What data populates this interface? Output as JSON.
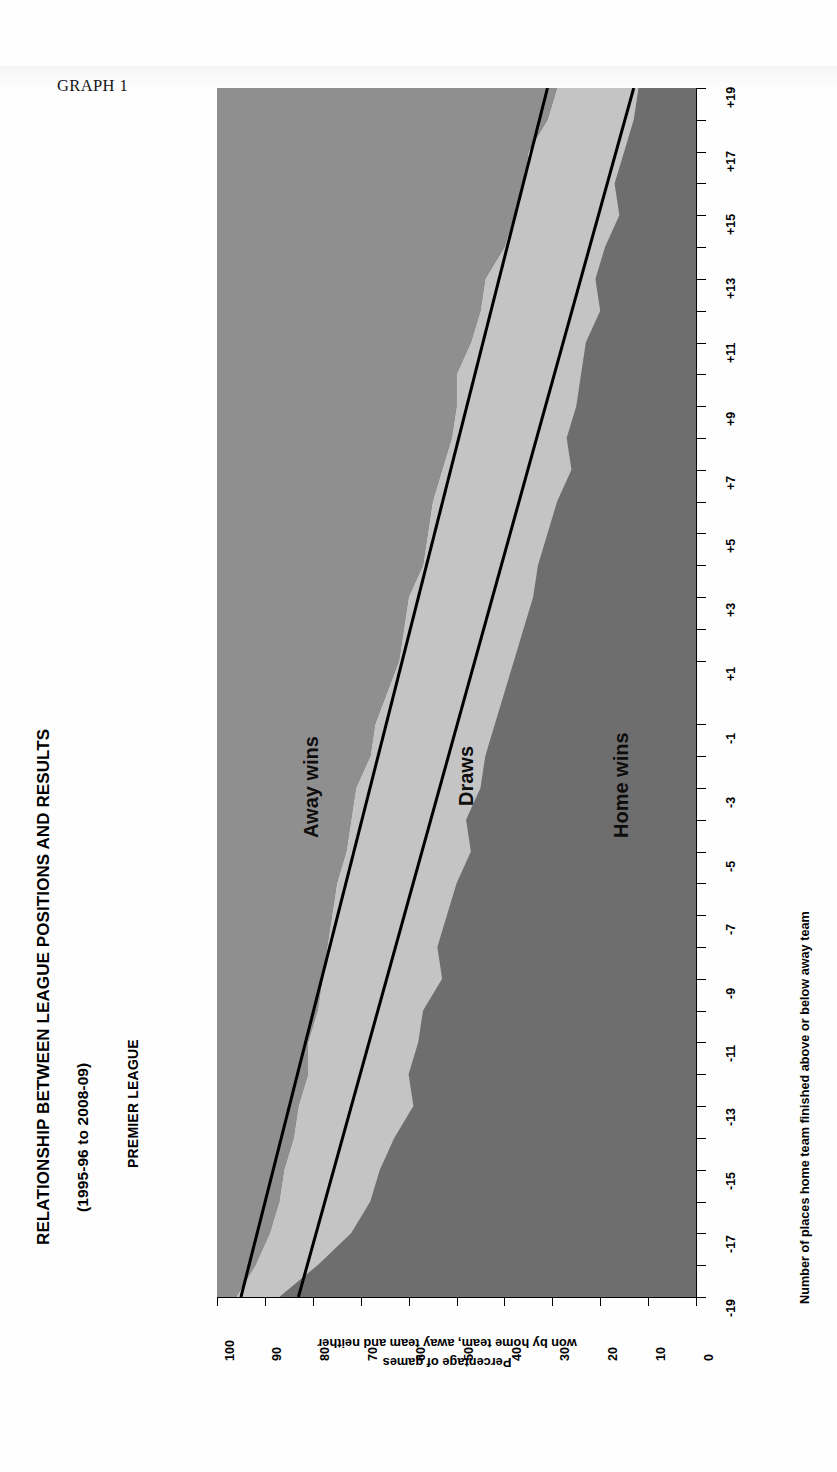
{
  "page": {
    "graph_label": "GRAPH 1"
  },
  "header": {
    "title": "RELATIONSHIP BETWEEN LEAGUE POSITIONS AND RESULTS",
    "subtitle": "(1995-96 to 2008-09)",
    "league": "PREMIER LEAGUE"
  },
  "axes": {
    "x_title": "Number of places home team finished above or below away team",
    "y_title_line1": "Percentage of games",
    "y_title_line2": "won by home team, away team and neither",
    "y_ticks": [
      "100",
      "90",
      "80",
      "70",
      "60",
      "50",
      "40",
      "30",
      "20",
      "10",
      "0"
    ],
    "x_ticks": [
      "+19",
      "+17",
      "+15",
      "+13",
      "+11",
      "+9",
      "+7",
      "+5",
      "+3",
      "+1",
      "-1",
      "-3",
      "-5",
      "-7",
      "-9",
      "-11",
      "-13",
      "-15",
      "-17",
      "-19"
    ]
  },
  "series_labels": {
    "away": "Away wins",
    "draws": "Draws",
    "home": "Home wins"
  },
  "colors": {
    "home_wins": "#6e6e6e",
    "draws": "#c4c4c4",
    "away_wins": "#8f8f8f",
    "trend_line": "#000000",
    "paper": "#ffffff"
  },
  "chart_data": {
    "type": "area",
    "title": "RELATIONSHIP BETWEEN LEAGUE POSITIONS AND RESULTS",
    "subtitle": "(1995-96 to 2008-09) — PREMIER LEAGUE",
    "xlabel": "Number of places home team finished above or below away team",
    "ylabel": "Percentage of games won by home team, away team and neither",
    "stacked": true,
    "stack_total": 100,
    "grid": false,
    "legend": "inline-labels",
    "ylim": [
      0,
      100
    ],
    "yticks": [
      0,
      10,
      20,
      30,
      40,
      50,
      60,
      70,
      80,
      90,
      100
    ],
    "x": [
      19,
      18,
      17,
      16,
      15,
      14,
      13,
      12,
      11,
      10,
      9,
      8,
      7,
      6,
      5,
      4,
      3,
      2,
      1,
      -1,
      -2,
      -3,
      -4,
      -5,
      -6,
      -7,
      -8,
      -9,
      -10,
      -11,
      -12,
      -13,
      -14,
      -15,
      -16,
      -17,
      -18,
      -19
    ],
    "xticks": [
      19,
      17,
      15,
      13,
      11,
      9,
      7,
      5,
      3,
      1,
      -1,
      -3,
      -5,
      -7,
      -9,
      -11,
      -13,
      -15,
      -17,
      -19
    ],
    "xticklabels": [
      "+19",
      "+17",
      "+15",
      "+13",
      "+11",
      "+9",
      "+7",
      "+5",
      "+3",
      "+1",
      "-1",
      "-3",
      "-5",
      "-7",
      "-9",
      "-11",
      "-13",
      "-15",
      "-17",
      "-19"
    ],
    "series": [
      {
        "name": "Home wins",
        "color": "#6e6e6e",
        "values": [
          12,
          13,
          15,
          17,
          16,
          19,
          21,
          20,
          23,
          24,
          25,
          27,
          26,
          29,
          31,
          33,
          34,
          36,
          38,
          42,
          44,
          45,
          48,
          47,
          50,
          52,
          54,
          53,
          57,
          58,
          60,
          59,
          63,
          66,
          68,
          72,
          79,
          87
        ]
      },
      {
        "name": "Draws",
        "color": "#c4c4c4",
        "values": [
          17,
          18,
          20,
          19,
          22,
          21,
          23,
          25,
          24,
          26,
          25,
          24,
          27,
          26,
          25,
          24,
          26,
          25,
          24,
          25,
          24,
          26,
          24,
          26,
          25,
          24,
          23,
          25,
          22,
          23,
          21,
          24,
          21,
          20,
          19,
          17,
          13,
          9
        ]
      },
      {
        "name": "Away wins",
        "color": "#8f8f8f",
        "values": [
          71,
          69,
          65,
          64,
          62,
          60,
          56,
          55,
          53,
          50,
          50,
          49,
          47,
          45,
          44,
          43,
          40,
          39,
          38,
          33,
          32,
          29,
          28,
          27,
          25,
          24,
          23,
          22,
          21,
          19,
          19,
          17,
          16,
          14,
          13,
          11,
          8,
          4
        ]
      }
    ],
    "trend_lines": [
      {
        "name": "Home wins trend",
        "color": "#000000",
        "from": {
          "x": 19,
          "y": 13
        },
        "to": {
          "x": -19,
          "y": 83
        }
      },
      {
        "name": "Home wins plus draws trend",
        "color": "#000000",
        "from": {
          "x": 19,
          "y": 31
        },
        "to": {
          "x": -19,
          "y": 95
        }
      }
    ]
  }
}
